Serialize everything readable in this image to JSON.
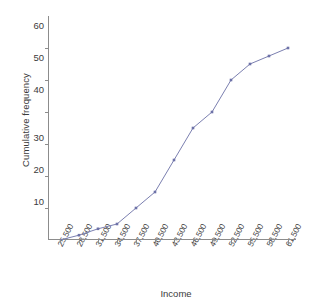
{
  "chart_data": {
    "type": "line",
    "title": "",
    "xlabel": "Income",
    "ylabel": "Cumulative frequency",
    "categories": [
      "25,500",
      "28,500",
      "31,500",
      "34,500",
      "37,500",
      "40,500",
      "43,500",
      "46,500",
      "49,500",
      "52,500",
      "55,500",
      "58,500",
      "61,500"
    ],
    "values": [
      0,
      1.5,
      3.5,
      5,
      10,
      15,
      25,
      35,
      40,
      50,
      55,
      57.5,
      60
    ],
    "series": [
      {
        "name": "Cumulative frequency",
        "values": [
          0,
          1.5,
          3.5,
          5,
          10,
          15,
          25,
          35,
          40,
          50,
          55,
          57.5,
          60
        ]
      }
    ],
    "y_ticks": [
      10,
      20,
      30,
      40,
      50,
      60
    ],
    "ylim": [
      0,
      63
    ],
    "grid": false,
    "legend": false,
    "marker": "square",
    "line_color": "#7b7fb0",
    "marker_color": "#6d72a8",
    "axis_color": "#8c8c8c"
  },
  "axes": {
    "y_title": "Cumulative frequency",
    "x_title": "Income",
    "y_tick_labels": [
      "60",
      "50",
      "40",
      "30",
      "20",
      "10"
    ],
    "x_tick_labels": [
      "25,500",
      "28,500",
      "31,500",
      "34,500",
      "37,500",
      "40,500",
      "43,500",
      "46,500",
      "49,500",
      "52,500",
      "55,500",
      "58,500",
      "61,500"
    ]
  }
}
